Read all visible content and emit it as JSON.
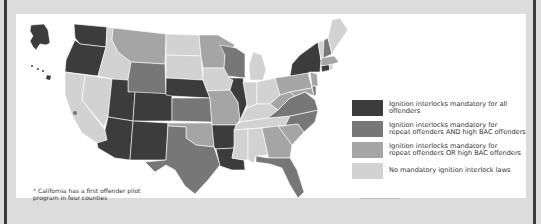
{
  "map": {
    "title": "",
    "colors": {
      "all_offenders": "#3c3c3c",
      "repeat_and_high_bac": "#777777",
      "repeat_or_high_bac": "#a5a5a5",
      "none": "#d2d2d2",
      "background": "#ffffff",
      "frame": "#dcdcdc",
      "border": "#3a3a3a"
    },
    "states": {
      "all_offenders": [
        "AK",
        "WA",
        "OR",
        "AZ",
        "UT",
        "CO",
        "NM",
        "NE",
        "IL",
        "AR",
        "LA",
        "NY",
        "CT",
        "HI"
      ],
      "repeat_and_high_bac": [
        "WY",
        "KS",
        "TX",
        "WI",
        "VA",
        "NC",
        "FL",
        "NH",
        "DE"
      ],
      "repeat_or_high_bac": [
        "MT",
        "MN",
        "OK",
        "MO",
        "PA",
        "GA",
        "SC",
        "WV",
        "MD",
        "NJ",
        "MA"
      ],
      "none": [
        "CA",
        "NV",
        "ID",
        "ND",
        "SD",
        "IA",
        "MI",
        "IN",
        "OH",
        "KY",
        "TN",
        "MS",
        "AL",
        "ME",
        "VT",
        "RI"
      ]
    }
  },
  "legend": {
    "items": [
      {
        "key": "all_offenders",
        "label": "Ignition interlocks mandatory for all offenders"
      },
      {
        "key": "repeat_and_high_bac",
        "label": "Ignition interlocks mandatory for\nrepeat offenders AND high BAC offenders"
      },
      {
        "key": "repeat_or_high_bac",
        "label": "Ignition interlocks mandatory for\nrepeat offenders OR high BAC offenders"
      },
      {
        "key": "none",
        "label": "No mandatory ignition interlock laws"
      }
    ]
  },
  "footnote": {
    "symbol": "*",
    "text": "California has a first offender pilot program in four counties"
  }
}
